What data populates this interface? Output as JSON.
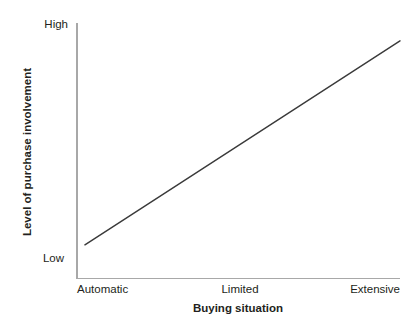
{
  "chart_data": {
    "type": "line",
    "title": "",
    "xlabel": "Buying situation",
    "ylabel": "Level of purchase involvement",
    "x_tick_labels": [
      "Automatic",
      "Limited",
      "Extensive"
    ],
    "y_tick_labels": [
      "Low",
      "High"
    ],
    "xlim": [
      0,
      2
    ],
    "ylim": [
      0,
      1
    ],
    "grid": false,
    "legend": null,
    "series": [
      {
        "name": "Level of purchase involvement",
        "color": "#3a3a3a",
        "x": [
          0.055,
          2.0
        ],
        "y": [
          0.13,
          0.93
        ],
        "points": [
          {
            "x_label": "Automatic",
            "x": 0.055,
            "y": 0.13
          },
          {
            "x_label": "Extensive",
            "x": 2.0,
            "y": 0.93
          }
        ]
      }
    ],
    "annotations": []
  },
  "axes": {
    "y": {
      "high_label": "High",
      "low_label": "Low",
      "title": "Level of purchase involvement"
    },
    "x": {
      "ticks": [
        {
          "label": "Automatic"
        },
        {
          "label": "Limited"
        },
        {
          "label": "Extensive"
        }
      ],
      "title": "Buying situation"
    }
  },
  "colors": {
    "background": "#ffffff",
    "axis": "#a8a8a8",
    "line": "#3a3a3a",
    "text": "#231f20"
  }
}
